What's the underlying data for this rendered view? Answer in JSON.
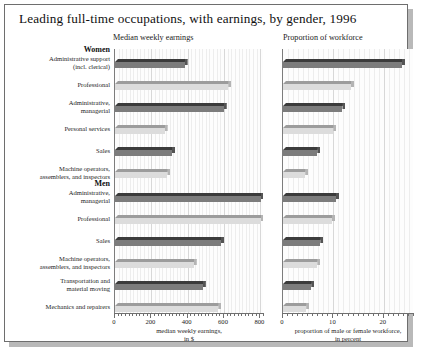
{
  "title": "Leading full-time occupations, with earnings, by gender, 1996",
  "panels": {
    "left": {
      "title": "Median weekly earnings",
      "axis_title_line1": "median weekly earnings,",
      "axis_title_line2": "in $",
      "ticks": [
        "0",
        "200",
        "400",
        "600",
        "800"
      ]
    },
    "right": {
      "title": "Proportion of  workforce",
      "axis_title_line1": "proportion of male or female workforce,",
      "axis_title_line2": "in percent",
      "ticks": [
        "0",
        "10",
        "20"
      ]
    }
  },
  "groups": [
    {
      "name": "Women"
    },
    {
      "name": "Men"
    }
  ],
  "categories": [
    {
      "l1": "Administrative support",
      "l2": "(incl. clerical)"
    },
    {
      "l1": "Professional",
      "l2": ""
    },
    {
      "l1": "Administrative,",
      "l2": "managerial"
    },
    {
      "l1": "Personal services",
      "l2": ""
    },
    {
      "l1": "Sales",
      "l2": ""
    },
    {
      "l1": "Machine operators,",
      "l2": "assemblers, and inspectors"
    },
    {
      "l1": "Administrative,",
      "l2": "managerial"
    },
    {
      "l1": "Professional",
      "l2": ""
    },
    {
      "l1": "Sales",
      "l2": ""
    },
    {
      "l1": "Machine operators,",
      "l2": "assemblers, and inspectors"
    },
    {
      "l1": "Transportation and",
      "l2": "material moving"
    },
    {
      "l1": "Mechanics and repairers",
      "l2": ""
    }
  ],
  "colors": {
    "bar_dark_face": "#7c7c7c",
    "bar_dark_top": "#3b3b3b",
    "bar_light_face": "#dcdcdc",
    "bar_light_top": "#9c9c9c",
    "grid": "#ededed",
    "axis": "#6f6f6f",
    "frame": "#6e6e6e",
    "shadow": "#b9b9b9"
  },
  "chart_data": {
    "type": "bar",
    "title": "Leading full-time occupations, with earnings, by gender, 1996",
    "orientation": "horizontal",
    "panels": [
      {
        "name": "Median weekly earnings",
        "xlabel": "median weekly earnings, in $",
        "xlim": [
          0,
          820
        ],
        "ticks": [
          0,
          200,
          400,
          600,
          800
        ],
        "minor_tick_step": 20,
        "grid": true,
        "groups": [
          {
            "name": "Women",
            "categories": [
              "Administrative support (incl. clerical)",
              "Professional",
              "Administrative, managerial",
              "Personal services",
              "Sales",
              "Machine operators, assemblers, and inspectors"
            ],
            "values": [
              400,
              640,
              615,
              290,
              330,
              305
            ]
          },
          {
            "name": "Men",
            "categories": [
              "Administrative, managerial",
              "Professional",
              "Sales",
              "Machine operators, assemblers, and inspectors",
              "Transportation and material moving",
              "Mechanics and repairers"
            ],
            "values": [
              820,
              820,
              600,
              450,
              500,
              585
            ]
          }
        ]
      },
      {
        "name": "Proportion of  workforce",
        "xlabel": "proportion of male or female workforce, in percent",
        "xlim": [
          0,
          26
        ],
        "ticks": [
          0,
          10,
          20
        ],
        "minor_tick_step": 1,
        "grid": true,
        "groups": [
          {
            "name": "Women",
            "categories": [
              "Administrative support (incl. clerical)",
              "Professional",
              "Administrative, managerial",
              "Personal services",
              "Sales",
              "Machine operators, assemblers, and inspectors"
            ],
            "values": [
              24.2,
              14.1,
              12.4,
              10.6,
              7.4,
              5.0
            ]
          },
          {
            "name": "Men",
            "categories": [
              "Administrative, managerial",
              "Professional",
              "Sales",
              "Machine operators, assemblers, and inspectors",
              "Transportation and material moving",
              "Mechanics and repairers"
            ],
            "values": [
              11.1,
              10.3,
              8.0,
              7.4,
              6.2,
              5.2
            ]
          }
        ]
      }
    ]
  }
}
